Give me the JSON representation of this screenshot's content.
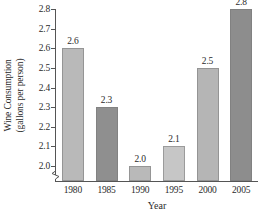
{
  "chart_data": {
    "type": "bar",
    "title": "",
    "subtitle": "",
    "xlabel": "Year",
    "ylabel": "Wine Consumption (gallons per person)",
    "ylabel_line1": "Wine Consumption",
    "ylabel_line2": "(gallons per person)",
    "categories": [
      "1980",
      "1985",
      "1990",
      "1995",
      "2000",
      "2005"
    ],
    "values": [
      2.6,
      2.3,
      2.0,
      2.1,
      2.5,
      2.8
    ],
    "value_labels": [
      "2.6",
      "2.3",
      "2.0",
      "2.1",
      "2.5",
      "2.8"
    ],
    "ylim": [
      1.95,
      2.8
    ],
    "ytick_labels": [
      "2.8",
      "2.7",
      "2.6",
      "2.5",
      "2.4",
      "2.3",
      "2.2",
      "2.1",
      "2.0"
    ],
    "ytick_values": [
      2.8,
      2.7,
      2.6,
      2.5,
      2.4,
      2.3,
      2.2,
      2.1,
      2.0
    ],
    "grid": false,
    "legend": false,
    "axis_break": true,
    "bar_colors": [
      "#b9b9b9",
      "#8f8f8f",
      "#b9b9b9",
      "#c6c6c6",
      "#b5b5b5",
      "#8d8d8d"
    ],
    "colors": {
      "background": "#ffffff",
      "axis": "#555555",
      "text": "#2b2b2b",
      "bar_light": "#b9b9b9",
      "bar_dark": "#8f8f8f"
    }
  }
}
